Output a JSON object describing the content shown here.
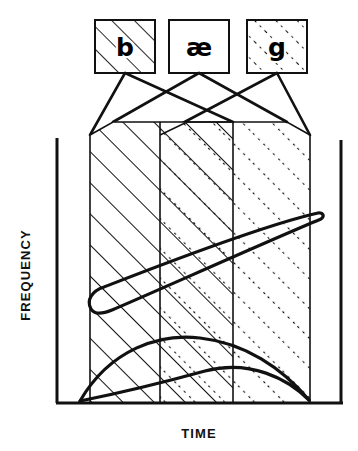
{
  "figure": {
    "type": "schematic-diagram",
    "title": "",
    "background_color": "#ffffff",
    "stroke_color": "#111111"
  },
  "phoneme_boxes": [
    {
      "id": "box-b",
      "label": "b",
      "fill_pattern": "diagonal-lines",
      "pattern_name": "solid-diagonal-hatch",
      "x": 95,
      "y": 20,
      "width": 60,
      "height": 53
    },
    {
      "id": "box-ae",
      "label": "æ",
      "fill_pattern": "plain",
      "pattern_name": "blank-white",
      "x": 169,
      "y": 20,
      "width": 60,
      "height": 53
    },
    {
      "id": "box-g",
      "label": "g",
      "fill_pattern": "dotted-diagonal-lines",
      "pattern_name": "dotted-diagonal-hatch",
      "x": 247,
      "y": 20,
      "width": 60,
      "height": 53
    }
  ],
  "axes": {
    "y_label": "FREQUENCY",
    "x_label": "TIME",
    "y_axis": {
      "x": 57,
      "y_top": 138,
      "y_bottom": 403
    },
    "x_axis": {
      "y": 403,
      "x_left": 57,
      "x_right": 342
    },
    "right_axis": {
      "x": 341,
      "y_top": 140,
      "y_bottom": 403
    }
  },
  "spectrogram_regions": [
    {
      "id": "region-b",
      "phoneme": "b",
      "pattern": "solid-diagonal-hatch",
      "x_start": 90,
      "x_end": 233,
      "y_top": 135,
      "y_bottom": 403
    },
    {
      "id": "region-ae",
      "phoneme": "æ",
      "pattern": "plain-overlap",
      "x_start": 160,
      "x_end": 233,
      "y_top": 122,
      "y_bottom": 403
    },
    {
      "id": "region-g",
      "phoneme": "g",
      "pattern": "dotted-diagonal-hatch",
      "x_start": 160,
      "x_end": 310,
      "y_top": 135,
      "y_bottom": 403
    }
  ],
  "formants": [
    {
      "id": "formant-2",
      "name": "second-formant",
      "description": "rising narrow lens from lower-left to upper-right",
      "start": {
        "x": 90,
        "y": 308
      },
      "end": {
        "x": 320,
        "y": 214
      },
      "stroke_width": 3.2
    },
    {
      "id": "formant-1",
      "name": "first-formant",
      "description": "low broad arc lens spanning the baseline",
      "start": {
        "x": 80,
        "y": 400
      },
      "end": {
        "x": 310,
        "y": 400
      },
      "peak_y": 344,
      "stroke_width": 3.2
    }
  ],
  "connector_lines": {
    "description": "crossing fan lines from each phoneme box down to the spectrogram region boundaries",
    "count": 6
  }
}
